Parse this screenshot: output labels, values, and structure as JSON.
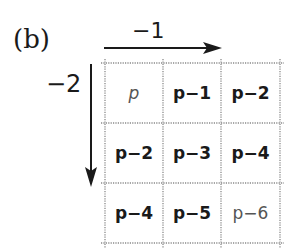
{
  "panel_label": "(b)",
  "horizontal_arrow": {
    "label": "−1",
    "direction": "right"
  },
  "vertical_arrow": {
    "label": "−2",
    "direction": "down"
  },
  "grid": {
    "rows": 3,
    "cols": 3,
    "cells": [
      [
        {
          "text": "p",
          "style": "light"
        },
        {
          "text": "p−1",
          "style": "bold"
        },
        {
          "text": "p−2",
          "style": "bold"
        }
      ],
      [
        {
          "text": "p−2",
          "style": "bold"
        },
        {
          "text": "p−3",
          "style": "bold"
        },
        {
          "text": "p−4",
          "style": "bold"
        }
      ],
      [
        {
          "text": "p−4",
          "style": "bold"
        },
        {
          "text": "p−5",
          "style": "bold"
        },
        {
          "text": "p−6",
          "style": "light"
        }
      ]
    ]
  },
  "colors": {
    "ink": "#1a1a1a",
    "grid_line": "#8a8a8a",
    "light_text": "#555555"
  }
}
